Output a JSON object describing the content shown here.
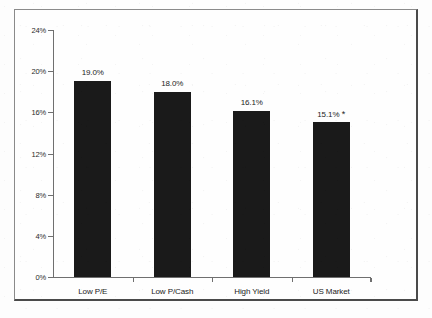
{
  "chart_data": {
    "type": "bar",
    "title": "",
    "xlabel": "",
    "ylabel": "",
    "categories": [
      "Low P/E",
      "Low P/Cash",
      "High Yield",
      "US Market"
    ],
    "values": [
      19.0,
      18.0,
      16.1,
      15.1
    ],
    "value_labels": [
      "19.0%",
      "18.0%",
      "16.1%",
      "15.1%"
    ],
    "annotations": [
      "",
      "",
      "",
      "*"
    ],
    "ylim": [
      0,
      24
    ],
    "ytick_labels": [
      "24%",
      "20%",
      "16%",
      "12%",
      "8%",
      "4%",
      "0%"
    ],
    "ytick_values": [
      24,
      20,
      16,
      12,
      8,
      4,
      0
    ],
    "grid": false,
    "legend": "none",
    "bar_color": "#1a1a1a",
    "axis_color": "#6f6f6f",
    "text_color": "#1c1c1c",
    "background_color": "#fdfdfd"
  }
}
